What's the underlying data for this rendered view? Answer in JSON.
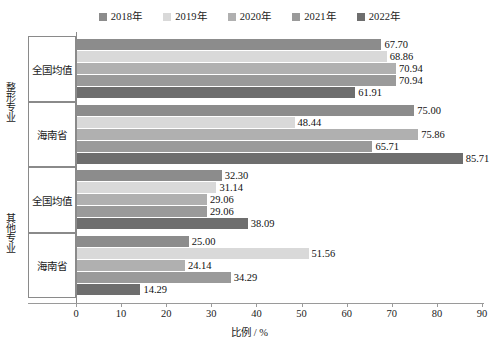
{
  "chart_data": {
    "type": "bar",
    "orientation": "horizontal",
    "title": "",
    "xlabel": "比例 / %",
    "ylabel": "",
    "xlim": [
      0,
      90
    ],
    "xticks": [
      0,
      10,
      20,
      30,
      40,
      50,
      60,
      70,
      80,
      90
    ],
    "grid": false,
    "legend_position": "top-center",
    "legend": [
      "2018年",
      "2019年",
      "2020年",
      "2021年",
      "2022年"
    ],
    "series_colors": [
      "#8c8c8c",
      "#d9d9d9",
      "#b0b0b0",
      "#9a9a9a",
      "#6e6e6e"
    ],
    "groups": [
      {
        "group_label": "整形专业",
        "categories": [
          "全国均值",
          "海南省"
        ]
      },
      {
        "group_label": "其他专业",
        "categories": [
          "全国均值",
          "海南省"
        ]
      }
    ],
    "categories": [
      "整形专业 / 全国均值",
      "整形专业 / 海南省",
      "其他专业 / 全国均值",
      "其他专业 / 海南省"
    ],
    "series": [
      {
        "name": "2018年",
        "values": [
          67.7,
          75.0,
          32.3,
          25.0
        ]
      },
      {
        "name": "2019年",
        "values": [
          68.86,
          48.44,
          31.14,
          51.56
        ]
      },
      {
        "name": "2020年",
        "values": [
          70.94,
          75.86,
          29.06,
          24.14
        ]
      },
      {
        "name": "2021年",
        "values": [
          70.94,
          65.71,
          29.06,
          34.29
        ]
      },
      {
        "name": "2022年",
        "values": [
          61.91,
          85.71,
          38.09,
          14.29
        ]
      }
    ],
    "value_labels": [
      [
        "67.70",
        "68.86",
        "70.94",
        "70.94",
        "61.91"
      ],
      [
        "75.00",
        "48.44",
        "75.86",
        "65.71",
        "85.71"
      ],
      [
        "32.30",
        "31.14",
        "29.06",
        "29.06",
        "38.09"
      ],
      [
        "25.00",
        "51.56",
        "24.14",
        "34.29",
        "14.29"
      ]
    ]
  }
}
